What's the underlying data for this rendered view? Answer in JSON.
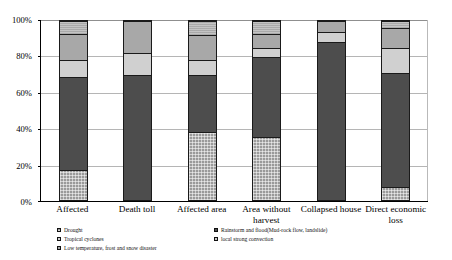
{
  "chart_data": {
    "type": "bar",
    "subtype": "stacked-percentage",
    "title": "",
    "xlabel": "",
    "ylabel": "",
    "ylim": [
      0,
      100
    ],
    "yticks": [
      "0%",
      "20%",
      "40%",
      "60%",
      "80%",
      "100%"
    ],
    "ytick_values": [
      0,
      20,
      40,
      60,
      80,
      100
    ],
    "grid": true,
    "legend_position": "bottom",
    "categories": [
      "Affected",
      "Death toll",
      "Affected area",
      "Area without harvest",
      "Collapsed house",
      "Direct economic loss"
    ],
    "series": [
      {
        "name": "Drought",
        "color": "#9a9a9a",
        "values": [
          17,
          0,
          38,
          35,
          0,
          7
        ]
      },
      {
        "name": "Rainstorm and flood(Mud-rock flow, landslide)",
        "color": "#4d4d4d",
        "values": [
          52,
          70,
          32,
          45,
          88,
          64
        ]
      },
      {
        "name": "Tropical cyclones",
        "color": "#d0d0d0",
        "values": [
          9,
          12,
          8,
          5,
          6,
          14
        ]
      },
      {
        "name": "Low temperature, frost and snow disaster",
        "color": "#a8a8a8",
        "values": [
          15,
          18,
          14,
          8,
          6,
          11
        ]
      },
      {
        "name": "local strong convection",
        "color": "#c4c4c4",
        "values": [
          7,
          0,
          8,
          7,
          0,
          4
        ]
      }
    ]
  },
  "legend": {
    "left_column": [
      "Drought",
      "Tropical cyclones",
      "Low temperature, frost and snow disaster"
    ],
    "right_column": [
      "Rainstorm and flood(Mud-rock flow, landslide)",
      "local strong convection"
    ]
  }
}
